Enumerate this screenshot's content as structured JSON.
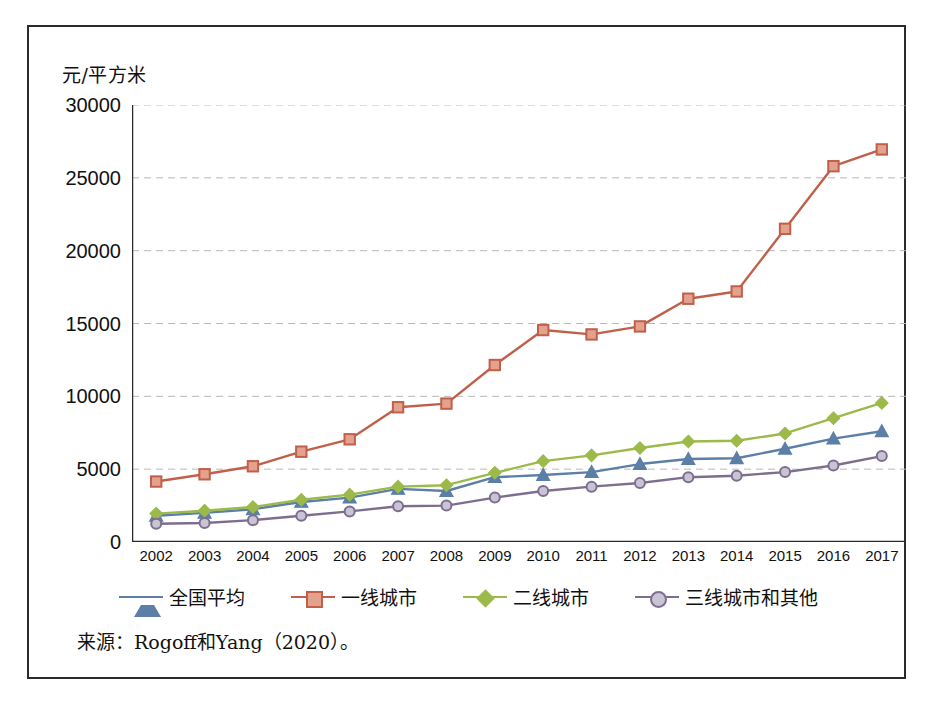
{
  "figure": {
    "y_axis_label": "元/平方米",
    "source_note": "来源：Rogoff和Yang（2020）。"
  },
  "colors": {
    "national_average": "#5B7FA6",
    "tier1": "#C0604A",
    "tier2": "#9CBA4A",
    "tier3_other": "#7E6E8E",
    "grid": "#b9b9b9",
    "axis": "#2b2b2b",
    "frame": "#2b2b2b"
  },
  "legend": {
    "position": "bottom",
    "items": [
      {
        "label": "全国平均",
        "color": "#5B7FA6",
        "marker": "triangle"
      },
      {
        "label": "一线城市",
        "color": "#C0604A",
        "marker": "square"
      },
      {
        "label": "二线城市",
        "color": "#9CBA4A",
        "marker": "diamond"
      },
      {
        "label": "三线城市和其他",
        "color": "#7E6E8E",
        "marker": "circle"
      }
    ]
  },
  "chart_data": {
    "type": "line",
    "title": "",
    "xlabel": "",
    "ylabel": "元/平方米",
    "grid": true,
    "xlim": [
      2002,
      2017
    ],
    "ylim": [
      0,
      30000
    ],
    "ytick_values": [
      0,
      5000,
      10000,
      15000,
      20000,
      25000,
      30000
    ],
    "ytick_labels": [
      "0",
      "5000",
      "10000",
      "15000",
      "20000",
      "25000",
      "30000"
    ],
    "x": [
      2002,
      2003,
      2004,
      2005,
      2006,
      2007,
      2008,
      2009,
      2010,
      2011,
      2012,
      2013,
      2014,
      2015,
      2016,
      2017
    ],
    "xtick_labels": [
      "2002",
      "2003",
      "2004",
      "2005",
      "2006",
      "2007",
      "2008",
      "2009",
      "2010",
      "2011",
      "2012",
      "2013",
      "2014",
      "2015",
      "2016",
      "2017"
    ],
    "series": [
      {
        "name": "全国平均",
        "color": "#5B7FA6",
        "marker": "triangle",
        "values": [
          1800,
          2000,
          2250,
          2750,
          3050,
          3650,
          3500,
          4450,
          4600,
          4800,
          5350,
          5700,
          5750,
          6400,
          7100,
          7600
        ]
      },
      {
        "name": "一线城市",
        "color": "#C0604A",
        "marker": "square",
        "values": [
          4150,
          4650,
          5200,
          6200,
          7050,
          9250,
          9500,
          12150,
          14550,
          14250,
          14800,
          16700,
          17200,
          21500,
          25800,
          26950
        ]
      },
      {
        "name": "二线城市",
        "color": "#9CBA4A",
        "marker": "diamond",
        "values": [
          1950,
          2150,
          2400,
          2900,
          3250,
          3800,
          3900,
          4750,
          5550,
          5950,
          6450,
          6900,
          6950,
          7450,
          8500,
          9550
        ]
      },
      {
        "name": "三线城市和其他",
        "color": "#7E6E8E",
        "marker": "circle",
        "values": [
          1250,
          1300,
          1500,
          1800,
          2100,
          2450,
          2500,
          3050,
          3500,
          3800,
          4050,
          4450,
          4550,
          4800,
          5250,
          5900
        ]
      }
    ]
  }
}
